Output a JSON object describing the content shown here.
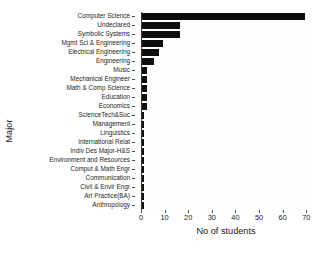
{
  "chart_data": {
    "type": "bar",
    "orientation": "horizontal",
    "title": "",
    "xlabel": "No of students",
    "ylabel": "Major",
    "xlim": [
      0,
      72
    ],
    "xticks": [
      0,
      10,
      20,
      30,
      40,
      50,
      60,
      70
    ],
    "grid": false,
    "bar_color": "#0d0d0d",
    "categories": [
      "Computer Science",
      "Undeclared",
      "Symbolic Systems",
      "Mgmt Sci & Engineering",
      "Electrical Engineering",
      "Engineering",
      "Music",
      "Mechanical Engineer",
      "Math & Comp Science",
      "Education",
      "Economics",
      "ScienceTech&Soc",
      "Management",
      "Linguistics",
      "International Relat",
      "Indiv Des Major-H&S",
      "Environment and Resources",
      "Comput & Math Engr",
      "Communication",
      "Civil & Envir Engr",
      "Art Practice(BA)",
      "Anthropology"
    ],
    "values": [
      69,
      16,
      16,
      9,
      7,
      5,
      2,
      2,
      2,
      2,
      2,
      1,
      1,
      1,
      1,
      1,
      1,
      1,
      1,
      1,
      1,
      1
    ]
  }
}
